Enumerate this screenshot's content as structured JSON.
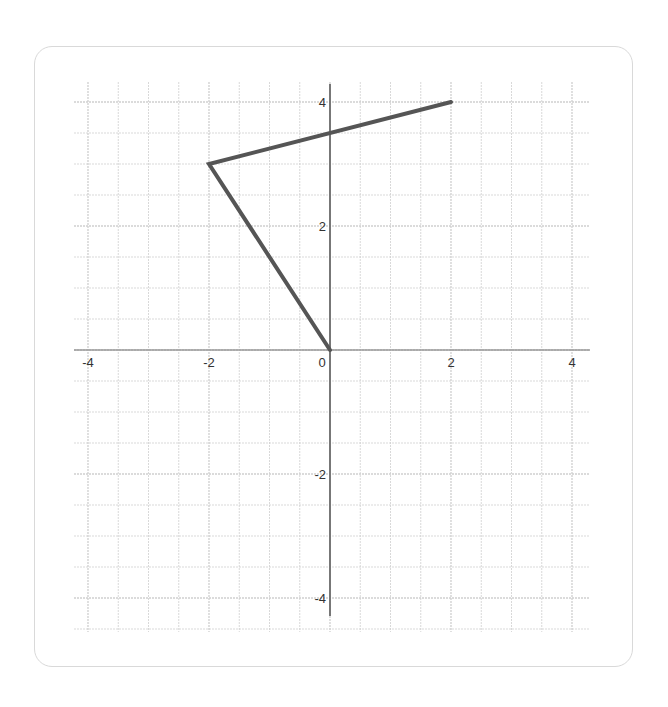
{
  "chart_data": {
    "type": "line",
    "title": "",
    "xlabel": "",
    "ylabel": "",
    "xlim": [
      -4.25,
      4.3
    ],
    "ylim": [
      -4.5,
      4.3
    ],
    "grid": true,
    "minor_grid_step": 0.5,
    "major_grid_step": 1,
    "x_ticks": [
      -4,
      -2,
      0,
      2,
      4
    ],
    "y_ticks": [
      4,
      2,
      -2,
      -4
    ],
    "x_tick_labels": [
      "-4",
      "-2",
      "0",
      "2",
      "4"
    ],
    "y_tick_labels": [
      "4",
      "2",
      "-2",
      "-4"
    ],
    "series": [
      {
        "name": "polyline",
        "color": "#555555",
        "points": [
          [
            2,
            4
          ],
          [
            -2,
            3
          ],
          [
            0,
            0
          ]
        ]
      }
    ]
  },
  "colors": {
    "grid": "#cfcfcf",
    "axis": "#777777",
    "line": "#555555",
    "card_border": "#d9d9d9"
  }
}
